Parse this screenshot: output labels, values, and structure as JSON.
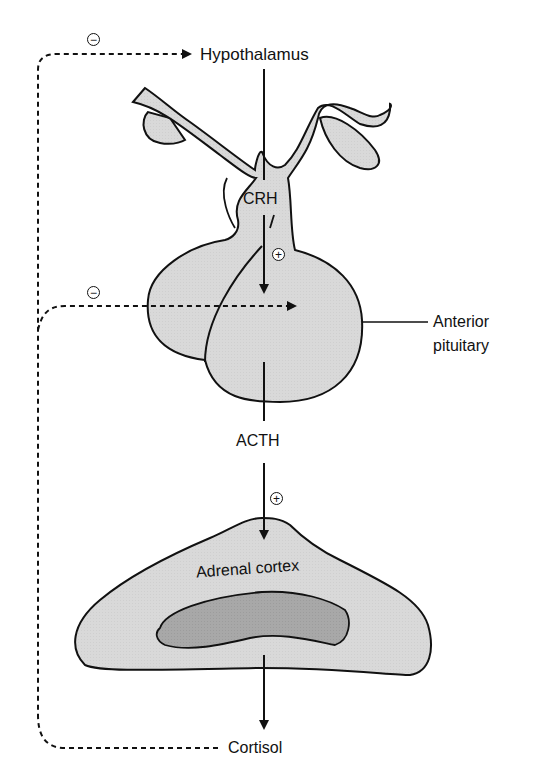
{
  "diagram": {
    "colors": {
      "fill_light": "#d9d9d9",
      "fill_dark": "#a6a6a6",
      "stroke": "#111111"
    },
    "nodes": {
      "hypothalamus": "Hypothalamus",
      "crh": "CRH",
      "anterior_pituitary_line1": "Anterior",
      "anterior_pituitary_line2": "pituitary",
      "acth": "ACTH",
      "adrenal_cortex": "Adrenal cortex",
      "cortisol": "Cortisol"
    },
    "symbols": {
      "inhibit": "−",
      "stimulate": "+"
    },
    "edges": [
      {
        "from": "Hypothalamus",
        "to": "Anterior pituitary",
        "via": "CRH",
        "effect": "+"
      },
      {
        "from": "Anterior pituitary",
        "to": "Adrenal cortex",
        "via": "ACTH",
        "effect": "+"
      },
      {
        "from": "Adrenal cortex",
        "to": "Cortisol",
        "effect": "output"
      },
      {
        "from": "Cortisol",
        "to": "Hypothalamus",
        "effect": "−",
        "style": "dashed"
      },
      {
        "from": "Cortisol",
        "to": "Anterior pituitary",
        "effect": "−",
        "style": "dashed"
      }
    ]
  }
}
